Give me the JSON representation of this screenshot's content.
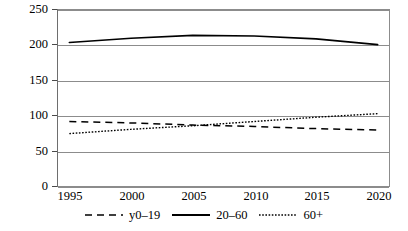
{
  "chart_data": {
    "type": "line",
    "title": "",
    "xlabel": "",
    "ylabel": "",
    "xlim": [
      1994,
      2021
    ],
    "ylim": [
      0,
      250
    ],
    "ytick_labels": [
      "0",
      "50",
      "100",
      "150",
      "200",
      "250"
    ],
    "ytick_values": [
      0,
      50,
      100,
      150,
      200,
      250
    ],
    "xtick_labels": [
      "1995",
      "2000",
      "2005",
      "2010",
      "2015",
      "2020"
    ],
    "xtick_values": [
      1995,
      2000,
      2005,
      2010,
      2015,
      2020
    ],
    "grid": true,
    "grid_axis": "y",
    "legend_position": "bottom",
    "x": [
      1995,
      2000,
      2005,
      2010,
      2015,
      2020
    ],
    "series": [
      {
        "name": "y0–19",
        "style": "dashed",
        "color": "#000000",
        "values": [
          92,
          90,
          87,
          85,
          82,
          80
        ]
      },
      {
        "name": "20–60",
        "style": "solid",
        "color": "#000000",
        "values": [
          203,
          209,
          213,
          212,
          208,
          200
        ]
      },
      {
        "name": "60+",
        "style": "dotted",
        "color": "#000000",
        "values": [
          75,
          81,
          86,
          92,
          98,
          103
        ]
      }
    ]
  },
  "axes": {
    "y_labels": [
      "250",
      "200",
      "150",
      "100",
      "50",
      "0"
    ],
    "x_labels": [
      "1995",
      "2000",
      "2005",
      "2010",
      "2015",
      "2020"
    ]
  },
  "legend": {
    "items": [
      {
        "label": "y0–19",
        "marker": "dashed-line-swatch"
      },
      {
        "label": "20–60",
        "marker": "solid-line-swatch"
      },
      {
        "label": "60+",
        "marker": "dotted-line-swatch"
      }
    ]
  }
}
